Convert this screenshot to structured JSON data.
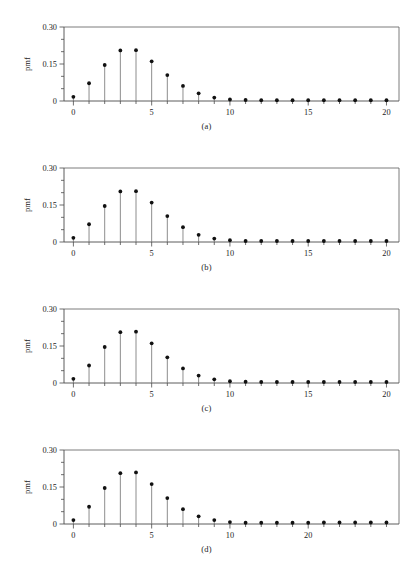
{
  "figure": {
    "type": "multi-panel-stem-plot",
    "panel_count": 4,
    "background_color": "#ffffff",
    "marker_color": "#111111",
    "stem_color": "#707070",
    "axis_color": "#4a4a4a"
  },
  "chart_data": [
    {
      "type": "scatter",
      "subtype": "stem",
      "title": "",
      "caption": "(a)",
      "xlabel": "",
      "ylabel": "pmf",
      "xlim": [
        -0.6,
        20.8
      ],
      "ylim": [
        0,
        0.3
      ],
      "grid": false,
      "legend": null,
      "xticks": [
        0,
        1,
        2,
        3,
        4,
        5,
        6,
        7,
        8,
        9,
        10,
        11,
        12,
        13,
        14,
        15,
        16,
        17,
        18,
        19,
        20
      ],
      "xticklabels": [
        "0",
        "",
        "",
        "",
        "",
        "5",
        "",
        "",
        "",
        "",
        "10",
        "",
        "",
        "",
        "",
        "15",
        "",
        "",
        "",
        "",
        "20"
      ],
      "yticks": [
        0,
        0.05,
        0.1,
        0.15,
        0.2,
        0.25,
        0.3
      ],
      "yticklabels": [
        "0",
        "",
        "",
        "0.15",
        "",
        "",
        "0.30"
      ],
      "x": [
        0,
        1,
        2,
        3,
        4,
        5,
        6,
        7,
        8,
        9,
        10,
        11,
        12,
        13,
        14,
        15,
        16,
        17,
        18,
        19,
        20
      ],
      "values": [
        0.017,
        0.072,
        0.146,
        0.205,
        0.206,
        0.161,
        0.105,
        0.061,
        0.031,
        0.014,
        0.006,
        0.004,
        0.003,
        0.003,
        0.003,
        0.003,
        0.003,
        0.003,
        0.003,
        0.003,
        0.003
      ]
    },
    {
      "type": "scatter",
      "subtype": "stem",
      "title": "",
      "caption": "(b)",
      "xlabel": "",
      "ylabel": "pmf",
      "xlim": [
        -0.6,
        20.8
      ],
      "ylim": [
        0,
        0.3
      ],
      "grid": false,
      "legend": null,
      "xticks": [
        0,
        1,
        2,
        3,
        4,
        5,
        6,
        7,
        8,
        9,
        10,
        11,
        12,
        13,
        14,
        15,
        16,
        17,
        18,
        19,
        20
      ],
      "xticklabels": [
        "0",
        "",
        "",
        "",
        "",
        "5",
        "",
        "",
        "",
        "",
        "10",
        "",
        "",
        "",
        "",
        "15",
        "",
        "",
        "",
        "",
        "20"
      ],
      "yticks": [
        0,
        0.05,
        0.1,
        0.15,
        0.2,
        0.25,
        0.3
      ],
      "yticklabels": [
        "0",
        "",
        "",
        "0.15",
        "",
        "",
        "0.30"
      ],
      "x": [
        0,
        1,
        2,
        3,
        4,
        5,
        6,
        7,
        8,
        9,
        10,
        11,
        12,
        13,
        14,
        15,
        16,
        17,
        18,
        19,
        20
      ],
      "values": [
        0.017,
        0.072,
        0.146,
        0.205,
        0.206,
        0.16,
        0.105,
        0.06,
        0.029,
        0.014,
        0.007,
        0.004,
        0.004,
        0.004,
        0.004,
        0.004,
        0.004,
        0.004,
        0.004,
        0.004,
        0.004
      ]
    },
    {
      "type": "scatter",
      "subtype": "stem",
      "title": "",
      "caption": "(c)",
      "xlabel": "",
      "ylabel": "pmf",
      "xlim": [
        -0.6,
        20.8
      ],
      "ylim": [
        0,
        0.3
      ],
      "grid": false,
      "legend": null,
      "xticks": [
        0,
        1,
        2,
        3,
        4,
        5,
        6,
        7,
        8,
        9,
        10,
        11,
        12,
        13,
        14,
        15,
        16,
        17,
        18,
        19,
        20
      ],
      "xticklabels": [
        "0",
        "",
        "",
        "",
        "",
        "5",
        "",
        "",
        "",
        "",
        "10",
        "",
        "",
        "",
        "",
        "15",
        "",
        "",
        "",
        "",
        "20"
      ],
      "yticks": [
        0,
        0.05,
        0.1,
        0.15,
        0.2,
        0.25,
        0.3
      ],
      "yticklabels": [
        "0",
        "",
        "",
        "0.15",
        "",
        "",
        "0.30"
      ],
      "x": [
        0,
        1,
        2,
        3,
        4,
        5,
        6,
        7,
        8,
        9,
        10,
        11,
        12,
        13,
        14,
        15,
        16,
        17,
        18,
        19,
        20
      ],
      "values": [
        0.017,
        0.071,
        0.146,
        0.206,
        0.208,
        0.161,
        0.104,
        0.059,
        0.03,
        0.015,
        0.007,
        0.005,
        0.004,
        0.004,
        0.004,
        0.004,
        0.004,
        0.004,
        0.004,
        0.004,
        0.004
      ]
    },
    {
      "type": "scatter",
      "subtype": "stem",
      "title": "",
      "caption": "(d)",
      "xlabel": "",
      "ylabel": "pmf",
      "xlim": [
        -0.6,
        20.8
      ],
      "ylim": [
        0,
        0.3
      ],
      "grid": false,
      "legend": null,
      "xticks": [
        0,
        1,
        2,
        3,
        4,
        5,
        6,
        7,
        8,
        9,
        10,
        11,
        12,
        13,
        14,
        15,
        16,
        17,
        18,
        19,
        20
      ],
      "xticklabels": [
        "0",
        "",
        "",
        "",
        "",
        "5",
        "",
        "",
        "",
        "",
        "10",
        "",
        "",
        "",
        "",
        "20"
      ],
      "yticks": [
        0,
        0.05,
        0.1,
        0.15,
        0.2,
        0.25,
        0.3
      ],
      "yticklabels": [
        "0",
        "",
        "",
        "0.15",
        "",
        "",
        "0.30"
      ],
      "x": [
        0,
        1,
        2,
        3,
        4,
        5,
        6,
        7,
        8,
        9,
        10,
        11,
        12,
        13,
        14,
        15,
        16,
        17,
        18,
        19,
        20
      ],
      "values": [
        0.016,
        0.07,
        0.146,
        0.206,
        0.209,
        0.162,
        0.105,
        0.06,
        0.031,
        0.016,
        0.008,
        0.005,
        0.005,
        0.005,
        0.005,
        0.005,
        0.006,
        0.006,
        0.006,
        0.006,
        0.006
      ]
    }
  ],
  "panels": [
    {
      "caption": "(a)",
      "ylabel": "pmf",
      "ytop_label": "0.30",
      "ymid_label": "0.15",
      "ybot_label": "0"
    },
    {
      "caption": "(b)",
      "ylabel": "pmf",
      "ytop_label": "0.30",
      "ymid_label": "0.15",
      "ybot_label": "0"
    },
    {
      "caption": "(c)",
      "ylabel": "pmf",
      "ytop_label": "0.30",
      "ymid_label": "0.15",
      "ybot_label": "0"
    },
    {
      "caption": "(d)",
      "ylabel": "pmf",
      "ytop_label": "0.30",
      "ymid_label": "0.15",
      "ybot_label": "0"
    }
  ]
}
